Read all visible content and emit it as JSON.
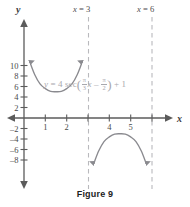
{
  "caption": "Figure 9",
  "axes": {
    "x_name": "x",
    "y_name": "y",
    "x_ticks": [
      "1",
      "2",
      "4",
      "5"
    ],
    "y_ticks_pos": [
      "10",
      "8",
      "6",
      "4",
      "2"
    ],
    "y_ticks_neg": [
      "–2",
      "–4",
      "–6",
      "–8"
    ]
  },
  "asymptote_labels": {
    "left": {
      "var": "x",
      "eq": " = 3"
    },
    "right": {
      "var": "x",
      "eq": " = 6"
    }
  },
  "equation": {
    "lhs": "y",
    "eq": " = 4 sec",
    "coef_num": "π",
    "coef_den": "3",
    "coef_var": "x",
    "minus": " – ",
    "shift_num": "π",
    "shift_den": "2",
    "tail": " + 1",
    "open_paren": "(",
    "close_paren": ")"
  },
  "colors": {
    "curve": "#8a8a8f",
    "axis": "#5b5b5b",
    "asymptote": "#b9b9bd",
    "equation_text": "#a8a8ad"
  },
  "chart_data": {
    "type": "line",
    "title": "Figure 9",
    "xlabel": "x",
    "ylabel": "y",
    "xlim": [
      -0.75,
      6.75
    ],
    "ylim": [
      -9.2,
      11.2
    ],
    "grid": false,
    "legend": null,
    "function": "y = 4 sec((π/3)x – π/2) + 1",
    "amplitude": 4,
    "period": 6,
    "vertical_shift": 1,
    "phase_shift": 1.5,
    "asymptotes": [
      3,
      6
    ],
    "x_tick_values": [
      1,
      2,
      4,
      5
    ],
    "y_tick_values": [
      10,
      8,
      6,
      4,
      2,
      -2,
      -4,
      -6,
      -8
    ],
    "series": [
      {
        "name": "upper-branch",
        "x": [
          0.28,
          0.5,
          0.75,
          1.0,
          1.25,
          1.5,
          1.75,
          2.0,
          2.25,
          2.5,
          2.72
        ],
        "y": [
          10.6,
          8.3,
          6.5,
          5.6,
          5.07,
          5.0,
          5.07,
          5.6,
          6.5,
          8.3,
          10.6
        ]
      },
      {
        "name": "lower-branch",
        "x": [
          3.28,
          3.5,
          3.75,
          4.0,
          4.25,
          4.5,
          4.75,
          5.0,
          5.25,
          5.5,
          5.72
        ],
        "y": [
          -8.6,
          -6.3,
          -4.5,
          -3.6,
          -3.07,
          -3.0,
          -3.07,
          -3.6,
          -4.5,
          -6.3,
          -8.6
        ]
      }
    ]
  }
}
